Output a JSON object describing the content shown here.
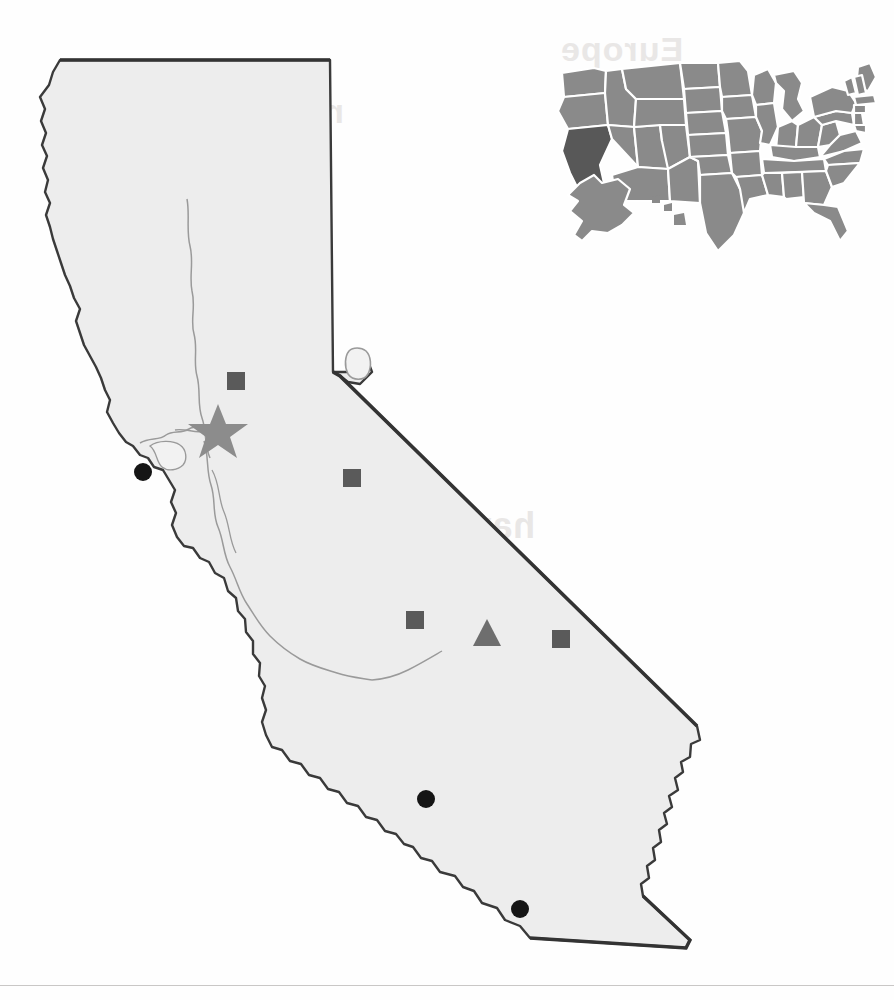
{
  "page": {
    "background_color": "#fefefe",
    "width": 894,
    "height": 1000,
    "bottom_rule_color": "#c9c7c6"
  },
  "main_map": {
    "name": "California",
    "fill_color": "#ededed",
    "outline_color": "#3a3a3a",
    "interior_line_color": "#9a9a9a",
    "lake_tahoe_label": "Lake Tahoe"
  },
  "inset_map": {
    "name": "United States",
    "state_fill_color": "#8a8a8a",
    "highlight_fill_color": "#585858",
    "border_color": "#ffffff",
    "highlighted_state": "California"
  },
  "markers": [
    {
      "id": "capital",
      "symbol": "star",
      "label": "Sacramento",
      "color": "#8c8c8c",
      "x": 218,
      "y": 428,
      "size": 44
    },
    {
      "id": "city-1",
      "symbol": "square",
      "label": "Chico",
      "color": "#5a5a5a",
      "x": 236,
      "y": 381,
      "size": 17
    },
    {
      "id": "city-2",
      "symbol": "square",
      "label": "Stockton",
      "color": "#5a5a5a",
      "x": 352,
      "y": 478,
      "size": 17
    },
    {
      "id": "city-3",
      "symbol": "square",
      "label": "Fresno",
      "color": "#5a5a5a",
      "x": 415,
      "y": 620,
      "size": 17
    },
    {
      "id": "city-4",
      "symbol": "square",
      "label": "Bakersfield",
      "color": "#5a5a5a",
      "x": 561,
      "y": 639,
      "size": 17
    },
    {
      "id": "site-1",
      "symbol": "triangle",
      "label": "Ridgecrest",
      "color": "#6e6e6e",
      "x": 487,
      "y": 633,
      "size": 26
    },
    {
      "id": "port-1",
      "symbol": "circle",
      "label": "San Francisco",
      "color": "#151515",
      "x": 143,
      "y": 472,
      "size": 18
    },
    {
      "id": "port-2",
      "symbol": "circle",
      "label": "Los Angeles",
      "color": "#151515",
      "x": 426,
      "y": 799,
      "size": 18
    },
    {
      "id": "port-3",
      "symbol": "circle",
      "label": "San Diego",
      "color": "#151515",
      "x": 520,
      "y": 909,
      "size": 18
    }
  ],
  "bleed_text": {
    "top_1": "may be a region",
    "top_2": "Europe",
    "mid_1": "have is   where   over",
    "mid_2": "ng that seasoned",
    "low_1": "continued in the second",
    "low_2": "the present and of the"
  }
}
